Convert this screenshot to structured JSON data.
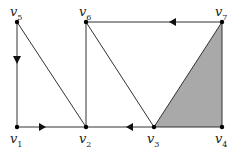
{
  "diagram": {
    "type": "graph",
    "vertices": [
      {
        "id": "v1",
        "label": "v",
        "sub": "1",
        "x": 17,
        "y": 127
      },
      {
        "id": "v2",
        "label": "v",
        "sub": "2",
        "x": 86,
        "y": 127
      },
      {
        "id": "v3",
        "label": "v",
        "sub": "3",
        "x": 154,
        "y": 127
      },
      {
        "id": "v4",
        "label": "v",
        "sub": "4",
        "x": 222,
        "y": 127
      },
      {
        "id": "v5",
        "label": "v",
        "sub": "5",
        "x": 17,
        "y": 22
      },
      {
        "id": "v6",
        "label": "v",
        "sub": "6",
        "x": 86,
        "y": 22
      },
      {
        "id": "v7",
        "label": "v",
        "sub": "7",
        "x": 222,
        "y": 22
      }
    ],
    "edges": [
      {
        "from": "v5",
        "to": "v1",
        "directed": true
      },
      {
        "from": "v1",
        "to": "v2",
        "directed": true
      },
      {
        "from": "v2",
        "to": "v3",
        "directed": false
      },
      {
        "from": "v3",
        "to": "v2",
        "directed": true
      },
      {
        "from": "v3",
        "to": "v4",
        "directed": false
      },
      {
        "from": "v5",
        "to": "v2",
        "directed": false
      },
      {
        "from": "v6",
        "to": "v2",
        "directed": false
      },
      {
        "from": "v6",
        "to": "v3",
        "directed": false
      },
      {
        "from": "v7",
        "to": "v6",
        "directed": true
      },
      {
        "from": "v7",
        "to": "v3",
        "directed": false
      },
      {
        "from": "v7",
        "to": "v4",
        "directed": false
      }
    ],
    "shaded_face": [
      "v3",
      "v7",
      "v4"
    ],
    "colors": {
      "stroke": "#333333",
      "fill": "#a9a9a9",
      "vertex": "#000000"
    }
  },
  "labels": {
    "v1": {
      "base": "v",
      "sub": "1"
    },
    "v2": {
      "base": "v",
      "sub": "2"
    },
    "v3": {
      "base": "v",
      "sub": "3"
    },
    "v4": {
      "base": "v",
      "sub": "4"
    },
    "v5": {
      "base": "v",
      "sub": "5"
    },
    "v6": {
      "base": "v",
      "sub": "6"
    },
    "v7": {
      "base": "v",
      "sub": "7"
    }
  }
}
